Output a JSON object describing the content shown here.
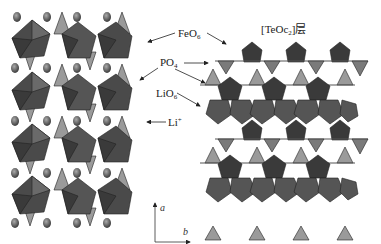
{
  "diagram": {
    "type": "crystal-structure",
    "panels": [
      {
        "name": "left-structure",
        "description": "polyhedral framework with Li+ ions in channels"
      },
      {
        "name": "right-structure",
        "description": "[TeOc2] layer view along a/b"
      }
    ],
    "labels": {
      "feo6": {
        "base": "FeO",
        "sub": "6"
      },
      "po4": {
        "base": "PO",
        "sub": "4"
      },
      "lio6": {
        "base": "LiO",
        "sub": "6"
      },
      "li": {
        "base": "Li",
        "sup": "+"
      },
      "layer": {
        "prefix": "[TeOc",
        "sub": "2",
        "suffix": "]层"
      }
    },
    "axes": {
      "vertical": "a",
      "horizontal": "b"
    },
    "colors": {
      "octahedron_dark": "#3a3a3a",
      "octahedron_mid": "#5a5a5a",
      "tetrahedron_light": "#9a9a9a",
      "li_sphere": "#555555",
      "arrow": "#222222",
      "background": "#ffffff"
    }
  }
}
